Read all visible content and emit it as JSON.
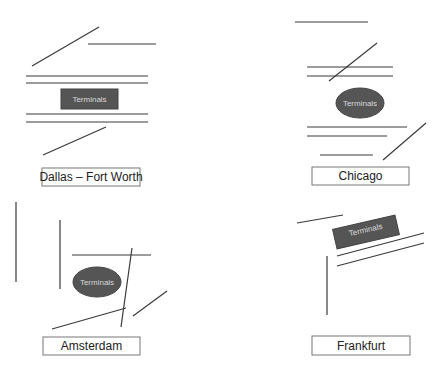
{
  "diagram": {
    "panels": [
      {
        "city": "Dallas – Fort Worth",
        "terminal_label": "Terminals",
        "terminal_shape": "rectangle"
      },
      {
        "city": "Chicago",
        "terminal_label": "Terminals",
        "terminal_shape": "ellipse"
      },
      {
        "city": "Amsterdam",
        "terminal_label": "Terminals",
        "terminal_shape": "ellipse"
      },
      {
        "city": "Frankfurt",
        "terminal_label": "Terminals",
        "terminal_shape": "rotated-rectangle"
      }
    ],
    "colors": {
      "runway": "#3a3a3a",
      "terminal_fill": "#555555",
      "terminal_text": "#d8d8d8",
      "label_border": "#777777"
    }
  }
}
